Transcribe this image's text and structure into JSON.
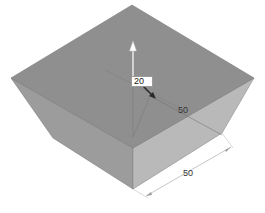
{
  "viewport": {
    "background": "#ffffff",
    "model": {
      "faces": {
        "top": {
          "color": "#8f8f8f"
        },
        "left": {
          "color": "#9c9c9c"
        },
        "right": {
          "color": "#b8b8b8"
        }
      }
    }
  },
  "dimensions": {
    "extrude_height": {
      "value": "20"
    },
    "depth": {
      "value": "50"
    },
    "width": {
      "value": "50"
    }
  },
  "manipulator": {
    "up_arrow": "arrow-up-icon",
    "drag_arrow": "arrow-diagonal-icon"
  }
}
